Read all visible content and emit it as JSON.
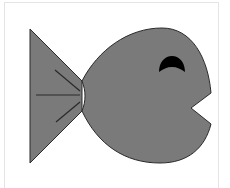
{
  "image": {
    "subject": "fish",
    "description": "Gray cartoon fish facing right with open mouth and crescent eye",
    "colors": {
      "background": "#ffffff",
      "frame": "#e4e4e4",
      "body_fill": "#7a7a7a",
      "outline": "#2a2a2a",
      "fin_lines": "#2a2a2a",
      "eye": "#000000"
    }
  }
}
